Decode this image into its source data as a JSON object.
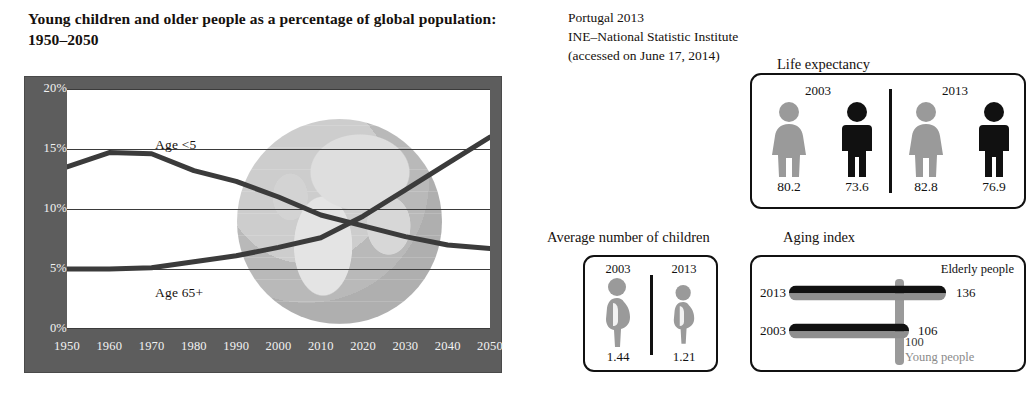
{
  "left": {
    "title": "Young children and older people as a percentage of global population: 1950–2050",
    "series_labels": {
      "young": "Age <5",
      "old": "Age 65+"
    }
  },
  "right": {
    "source_note": "Portugal 2013\nINE–National Statistic Institute\n(accessed on June 17, 2014)",
    "life_expectancy": {
      "heading": "Life expectancy",
      "groups": [
        {
          "year": "2003",
          "female": "80.2",
          "male": "73.6"
        },
        {
          "year": "2013",
          "female": "82.8",
          "male": "76.9"
        }
      ]
    },
    "children": {
      "heading": "Average number of children",
      "groups": [
        {
          "year": "2003",
          "value": "1.44"
        },
        {
          "year": "2013",
          "value": "1.21"
        }
      ]
    },
    "aging_index": {
      "heading": "Aging index",
      "elderly_label": "Elderly people",
      "young_label": "Young people",
      "reference_value": "100",
      "rows": [
        {
          "year": "2013",
          "value": "136"
        },
        {
          "year": "2003",
          "value": "106"
        }
      ]
    }
  },
  "chart_data": {
    "type": "line",
    "title": "Young children and older people as a percentage of global population: 1950–2050",
    "xlabel": "",
    "ylabel": "",
    "x": [
      1950,
      1960,
      1970,
      1980,
      1990,
      2000,
      2010,
      2020,
      2030,
      2040,
      2050
    ],
    "xlim": [
      1950,
      2050
    ],
    "ylim": [
      0,
      20
    ],
    "ytick_labels": [
      "0%",
      "5%",
      "10%",
      "15%",
      "20%"
    ],
    "yticks": [
      0,
      5,
      10,
      15,
      20
    ],
    "xtick_labels": [
      "1950",
      "1960",
      "1970",
      "1980",
      "1990",
      "2000",
      "2010",
      "2020",
      "2030",
      "2040",
      "2050"
    ],
    "grid": true,
    "legend": "inline-labels",
    "series": [
      {
        "name": "Age <5",
        "values": [
          13.5,
          14.7,
          14.6,
          13.2,
          12.3,
          11.0,
          9.5,
          8.6,
          7.7,
          7.0,
          6.7
        ]
      },
      {
        "name": "Age 65+",
        "values": [
          5.0,
          5.0,
          5.1,
          5.6,
          6.1,
          6.8,
          7.6,
          9.4,
          11.6,
          13.8,
          16.0
        ]
      }
    ],
    "colors": {
      "line": "#3b3b3b",
      "panel": "#5d5d5d",
      "plot_bg": "#ffffff"
    }
  }
}
